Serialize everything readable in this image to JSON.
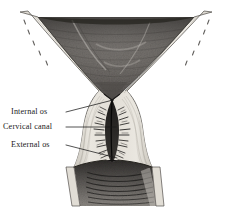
{
  "figure": {
    "type": "anatomical-engraving",
    "background_color": "#ffffff",
    "ink_color": "#1a1a1a",
    "wall_color": "#e4e1da",
    "cavity_color": "#6e6a66"
  },
  "labels": [
    {
      "id": "internal-os",
      "text": "Internal os",
      "leader": {
        "from_x": 66,
        "from_y": 112,
        "to_x": 113,
        "to_y": 100
      }
    },
    {
      "id": "cervical-canal",
      "text": "Cervical canal",
      "leader": {
        "from_x": 66,
        "from_y": 127,
        "to_x": 116,
        "to_y": 127
      }
    },
    {
      "id": "external-os",
      "text": "External os",
      "leader": {
        "from_x": 66,
        "from_y": 145,
        "to_x": 117,
        "to_y": 158
      }
    }
  ],
  "structures": [
    {
      "name": "uterine-cavity",
      "region": "upper-triangular-dark-interior"
    },
    {
      "name": "myometrium-wall",
      "region": "light-banded-outer-wall"
    },
    {
      "name": "internal-os",
      "region": "narrow-isthmus-junction"
    },
    {
      "name": "cervical-canal",
      "region": "fusiform-canal-with-arbor-vitae"
    },
    {
      "name": "external-os",
      "region": "opening-into-vaginal-vault"
    },
    {
      "name": "vaginal-canal",
      "region": "lower-rugated-passage"
    }
  ]
}
